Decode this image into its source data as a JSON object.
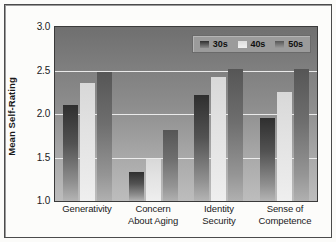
{
  "chart_data": {
    "type": "bar",
    "title": "",
    "xlabel": "",
    "ylabel": "Mean Self-Rating",
    "ylim": [
      1.0,
      3.0
    ],
    "ytick_labels": [
      "3.0",
      "2.5",
      "2.0",
      "1.5",
      "1.0"
    ],
    "ytick_values": [
      3.0,
      2.5,
      2.0,
      1.5,
      1.0
    ],
    "grid": true,
    "legend_position": "top-right-inside",
    "categories": [
      "Generativity",
      "Concern About Aging",
      "Identity Security",
      "Sense of Competence"
    ],
    "category_lines": [
      [
        "Generativity",
        ""
      ],
      [
        "Concern",
        "About Aging"
      ],
      [
        "Identity",
        "Security"
      ],
      [
        "Sense of",
        "Competence"
      ]
    ],
    "series": [
      {
        "name": "30s",
        "values": [
          2.1,
          1.33,
          2.22,
          1.95
        ],
        "color": "#3a3a3a"
      },
      {
        "name": "40s",
        "values": [
          2.36,
          1.48,
          2.42,
          2.25
        ],
        "color": "#e4e4e4"
      },
      {
        "name": "50s",
        "values": [
          2.48,
          1.82,
          2.52,
          2.52
        ],
        "color": "#6e6e6e"
      }
    ]
  },
  "legend": {
    "items": [
      {
        "label": "30s"
      },
      {
        "label": "40s"
      },
      {
        "label": "50s"
      }
    ]
  }
}
